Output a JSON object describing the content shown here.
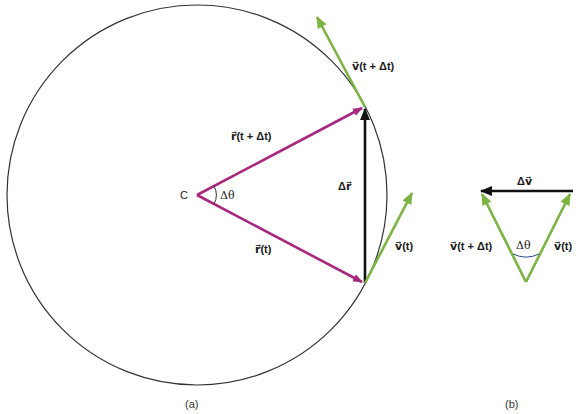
{
  "colors": {
    "circle": "#333333",
    "position_vector": "#a7287e",
    "velocity_vector": "#7cb342",
    "delta_vector": "#111111",
    "angle_arc_b": "#2a4a8a"
  },
  "panel_a": {
    "caption": "(a)",
    "center_label": "C",
    "angle_label": "Δθ",
    "r_t_label": "r⃗(t)",
    "r_t_dt_label": "r⃗(t + Δt)",
    "delta_r_label": "Δr⃗",
    "v_t_label": "v⃗(t)",
    "v_t_dt_label": "v⃗(t + Δt)"
  },
  "panel_b": {
    "caption": "(b)",
    "delta_v_label": "Δv⃗",
    "v_t_label": "v⃗(t)",
    "v_t_dt_label": "v⃗(t + Δt)",
    "angle_label": "Δθ"
  }
}
